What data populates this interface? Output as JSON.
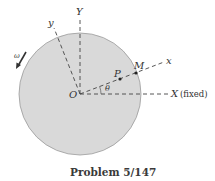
{
  "diagram": {
    "labels": {
      "Y": "Y",
      "y": "y",
      "x": "x",
      "X": "X",
      "fixed": "(fixed)",
      "O": "O",
      "P": "P",
      "M": "M",
      "theta": "θ",
      "omega": "ω"
    },
    "caption": "Problem 5/147",
    "colors": {
      "disc_fill": "#d9d9d9",
      "disc_stroke": "#9a9a9a",
      "line": "#444444"
    }
  }
}
